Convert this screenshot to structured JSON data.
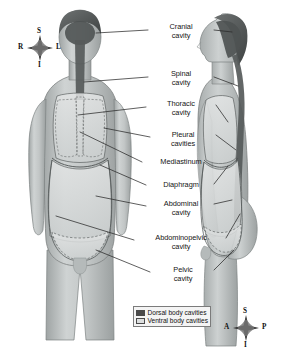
{
  "figure": {
    "view_left": "anterior view",
    "view_right": "lateral view",
    "background_color": "#ffffff",
    "body_fill_color": "#b9bdbd",
    "dorsal_cavity_color": "#4a4a4a",
    "ventral_cavity_color": "#d8dada",
    "outline_color": "#6e7272",
    "leader_line_color": "#2a2a2a"
  },
  "labels": [
    {
      "id": "cranial-cavity",
      "text": "Cranial\ncavity",
      "x": 150,
      "y": 23,
      "w": 62
    },
    {
      "id": "spinal-cavity",
      "text": "Spinal\ncavity",
      "x": 150,
      "y": 70,
      "w": 62
    },
    {
      "id": "thoracic-cavity",
      "text": "Thoracic\ncavity",
      "x": 148,
      "y": 100,
      "w": 66
    },
    {
      "id": "pleural-cavities",
      "text": "Pleural\ncavities",
      "x": 152,
      "y": 131,
      "w": 62
    },
    {
      "id": "mediastinum",
      "text": "Mediastinum",
      "x": 144,
      "y": 158,
      "w": 74
    },
    {
      "id": "diaphragm",
      "text": "Diaphragm",
      "x": 148,
      "y": 181,
      "w": 66
    },
    {
      "id": "abdominal-cavity",
      "text": "Abdominal\ncavity",
      "x": 148,
      "y": 200,
      "w": 66
    },
    {
      "id": "abdominopelvic-cavity",
      "text": "Abdominopelvic\ncavity",
      "x": 136,
      "y": 234,
      "w": 90
    },
    {
      "id": "pelvic-cavity",
      "text": "Pelvic\ncavity",
      "x": 152,
      "y": 266,
      "w": 62
    }
  ],
  "compass_top": {
    "name": "orientation-compass-anterior",
    "cx": 40,
    "cy": 48,
    "r": 13,
    "letters": [
      {
        "id": "superior",
        "text": "S",
        "x": 37,
        "y": 27
      },
      {
        "id": "inferior",
        "text": "I",
        "x": 38,
        "y": 61
      },
      {
        "id": "right",
        "text": "R",
        "x": 18,
        "y": 43
      },
      {
        "id": "left",
        "text": "L",
        "x": 56,
        "y": 43
      }
    ]
  },
  "compass_bottom": {
    "name": "orientation-compass-lateral",
    "cx": 246,
    "cy": 328,
    "r": 13,
    "letters": [
      {
        "id": "superior",
        "text": "S",
        "x": 243,
        "y": 307
      },
      {
        "id": "inferior",
        "text": "I",
        "x": 244,
        "y": 341
      },
      {
        "id": "anterior",
        "text": "A",
        "x": 224,
        "y": 323
      },
      {
        "id": "posterior",
        "text": "P",
        "x": 262,
        "y": 323
      }
    ]
  },
  "legend": {
    "items": [
      {
        "id": "dorsal-body-cavities",
        "label": "Dorsal body cavities",
        "color": "#4a4a4a"
      },
      {
        "id": "ventral-body-cavities",
        "label": "Ventral body cavities",
        "color": "#dcdede"
      }
    ]
  }
}
